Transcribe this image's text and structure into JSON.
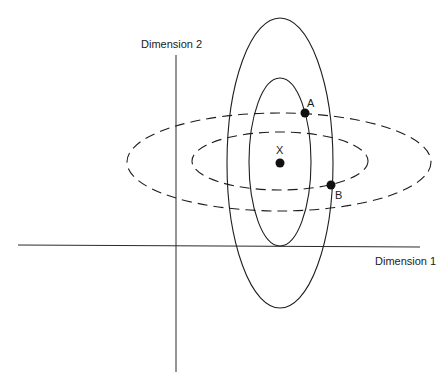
{
  "diagram": {
    "axes": {
      "x_label": "Dimension 1",
      "y_label": "Dimension 2"
    },
    "points": [
      {
        "id": "x",
        "label": "X",
        "cx": 280,
        "cy": 163
      },
      {
        "id": "a",
        "label": "A",
        "cx": 305,
        "cy": 113
      },
      {
        "id": "b",
        "label": "B",
        "cx": 331,
        "cy": 185
      }
    ],
    "ellipses": {
      "solid_outer": {
        "cx": 280,
        "cy": 163,
        "rx": 53,
        "ry": 145,
        "style": "solid"
      },
      "solid_inner": {
        "cx": 280,
        "cy": 162,
        "rx": 31,
        "ry": 84,
        "style": "solid"
      },
      "dashed_outer": {
        "cx": 279,
        "cy": 162,
        "rx": 152,
        "ry": 49,
        "style": "dashed"
      },
      "dashed_inner": {
        "cx": 280,
        "cy": 161,
        "rx": 88,
        "ry": 29,
        "style": "dashed"
      }
    },
    "colors": {
      "line": "#1e1e1e",
      "background": "#ffffff"
    }
  }
}
